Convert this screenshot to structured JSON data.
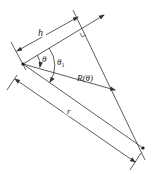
{
  "diagram": {
    "labels": {
      "h": "h",
      "theta": "θ",
      "theta1": "θ",
      "theta1_sub": "1",
      "R": "R(θ)",
      "r": "r"
    },
    "colors": {
      "line": "#333333",
      "background": "#ffffff"
    }
  }
}
